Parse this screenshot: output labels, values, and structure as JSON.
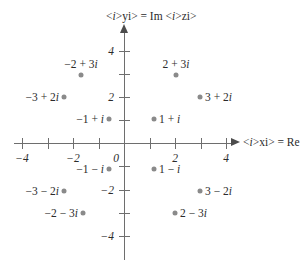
{
  "figure": {
    "type": "complex-plane-argand-diagram",
    "background_color": "#ffffff",
    "axis_color": "#6e6e6e",
    "point_color": "#8a8a8a",
    "text_color": "#2b2b2b"
  },
  "axes": {
    "x_caption": "x = Re z",
    "y_caption": "y = Im z",
    "origin_label": "0",
    "x_tick_labels": [
      "-4",
      "-2",
      "2",
      "4"
    ],
    "y_tick_labels": [
      "4",
      "2",
      "-2",
      "-4"
    ],
    "x_ticks_all": [
      -4,
      -3,
      -2,
      -1,
      1,
      2,
      3,
      4
    ],
    "y_ticks_all": [
      4,
      3,
      2,
      1,
      -1,
      -2,
      -3,
      -4
    ],
    "x_range": [
      -4.3,
      4.2
    ],
    "y_range": [
      -4.8,
      5.1
    ]
  },
  "chart_data": {
    "type": "scatter",
    "title": "",
    "xlabel": "x = Re z",
    "ylabel": "y = Im z",
    "xlim": [
      -4.3,
      4.2
    ],
    "ylim": [
      -4.8,
      5.1
    ],
    "grid": false,
    "legend": "none",
    "x_ticks": [
      -4,
      -2,
      2,
      4
    ],
    "y_ticks": [
      4,
      2,
      -2,
      -4
    ],
    "points": [
      {
        "label": "-2 + 3i",
        "re": -2,
        "im": 3,
        "label_pos": "above"
      },
      {
        "label": "2 + 3i",
        "re": 2,
        "im": 3,
        "label_pos": "above"
      },
      {
        "label": "-3 + 2i",
        "re": -3,
        "im": 2,
        "label_pos": "left"
      },
      {
        "label": "3 + 2i",
        "re": 3,
        "im": 2,
        "label_pos": "right"
      },
      {
        "label": "-1 + i",
        "re": -1,
        "im": 1,
        "label_pos": "left"
      },
      {
        "label": "1 + i",
        "re": 1,
        "im": 1,
        "label_pos": "right"
      },
      {
        "label": "-1 - i",
        "re": -1,
        "im": -1,
        "label_pos": "left"
      },
      {
        "label": "1 - i",
        "re": 1,
        "im": -1,
        "label_pos": "right"
      },
      {
        "label": "-3 - 2i",
        "re": -3,
        "im": -2,
        "label_pos": "left"
      },
      {
        "label": "3 - 2i",
        "re": 3,
        "im": -2,
        "label_pos": "right"
      },
      {
        "label": "-2 - 3i",
        "re": -2,
        "im": -3,
        "label_pos": "left"
      },
      {
        "label": "2 - 3i",
        "re": 2,
        "im": -3,
        "label_pos": "right"
      }
    ]
  },
  "labels": {
    "p_neg2_plus_3i": "-2 + 3i",
    "p_2_plus_3i": "2 + 3i",
    "p_neg3_plus_2i": "-3 + 2i",
    "p_3_plus_2i": "3 + 2i",
    "p_neg1_plus_i": "-1 + i",
    "p_1_plus_i": "1 + i",
    "p_neg1_minus_i": "-1 - i",
    "p_1_minus_i": "1 - i",
    "p_neg3_minus_2i": "-3 - 2i",
    "p_3_minus_2i": "3 - 2i",
    "p_neg2_minus_3i": "-2 - 3i",
    "p_2_minus_3i": "2 - 3i"
  },
  "tick_text": {
    "x_neg4": "-4",
    "x_neg2": "-2",
    "x_2": "2",
    "x_4": "4",
    "y_4": "4",
    "y_2": "2",
    "y_neg2": "-2",
    "y_neg4": "-4",
    "origin": "0"
  }
}
